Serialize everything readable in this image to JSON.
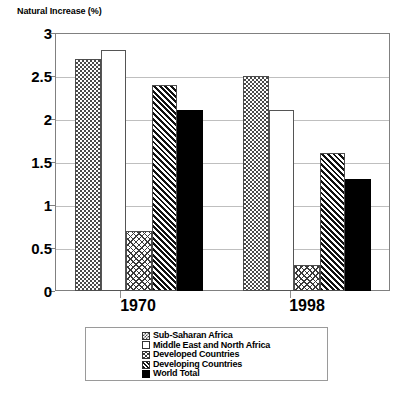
{
  "chart_data": {
    "type": "bar",
    "title": "Natural Increase (%)",
    "xlabel": "",
    "ylabel": "Natural Increase (%)",
    "categories": [
      "1970",
      "1998"
    ],
    "ylim": [
      0,
      3
    ],
    "yticks": [
      "0",
      "0.5",
      "1",
      "1.5",
      "2",
      "2.5",
      "3"
    ],
    "ytick_values": [
      0,
      0.5,
      1,
      1.5,
      2,
      2.5,
      3
    ],
    "grid": true,
    "legend_position": "bottom",
    "series": [
      {
        "name": "Sub-Saharan Africa",
        "pattern": "checker",
        "values": [
          2.7,
          2.5
        ]
      },
      {
        "name": "Middle East and North Africa",
        "pattern": "empty",
        "values": [
          2.8,
          2.1
        ]
      },
      {
        "name": "Developed Countries",
        "pattern": "xhatch",
        "values": [
          0.7,
          0.3
        ]
      },
      {
        "name": "Developing Countries",
        "pattern": "dhatch",
        "values": [
          2.4,
          1.6
        ]
      },
      {
        "name": "World Total",
        "pattern": "solid-black",
        "values": [
          2.1,
          1.3
        ]
      }
    ],
    "colors": {
      "axis": "#808080",
      "grid": "#bfbfbf",
      "bar_outline": "#4d4d4d",
      "world_total": "#000000",
      "background": "#ffffff"
    }
  }
}
